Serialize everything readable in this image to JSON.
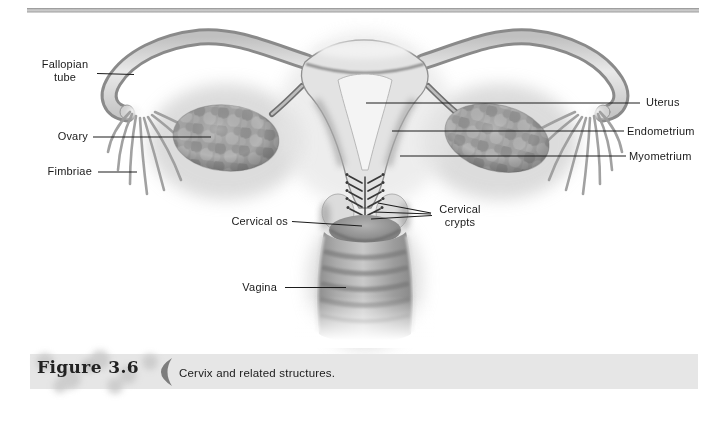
{
  "figure_type": "anatomical-diagram",
  "colors": {
    "background": "#ffffff",
    "leader_line": "#1c1c1c",
    "label_text": "#1a1a1a",
    "caption_band": "#e6e6e6",
    "top_rule": "#9a9a9a",
    "illustration_gray": "#bdbdbd"
  },
  "diagram": {
    "labels": [
      {
        "id": "fallopian-tube",
        "lines": [
          "Fallopian",
          "tube"
        ]
      },
      {
        "id": "ovary",
        "lines": [
          "Ovary"
        ]
      },
      {
        "id": "fimbriae",
        "lines": [
          "Fimbriae"
        ]
      },
      {
        "id": "uterus",
        "lines": [
          "Uterus"
        ]
      },
      {
        "id": "endometrium",
        "lines": [
          "Endometrium"
        ]
      },
      {
        "id": "myometrium",
        "lines": [
          "Myometrium"
        ]
      },
      {
        "id": "cervical-os",
        "lines": [
          "Cervical os"
        ]
      },
      {
        "id": "cervical-crypts",
        "lines": [
          "Cervical",
          "crypts"
        ]
      },
      {
        "id": "vagina",
        "lines": [
          "Vagina"
        ]
      }
    ]
  },
  "caption": {
    "figure_label": "Figure 3.6",
    "text": "Cervix and related structures."
  }
}
